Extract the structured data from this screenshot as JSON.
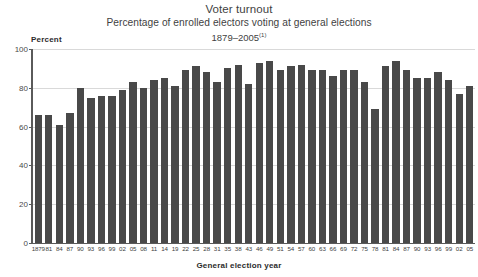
{
  "header": {
    "title": "Voter turnout",
    "subtitle": "Percentage of enrolled electors voting at general elections",
    "period": "1879–2005",
    "footnote_marker": "(1)"
  },
  "axes": {
    "y_axis_title": "Percent",
    "x_axis_title": "General election year",
    "y_ticks": [
      "0",
      "20",
      "40",
      "60",
      "80",
      "100"
    ]
  },
  "chart_data": {
    "type": "bar",
    "title": "Voter turnout",
    "subtitle": "Percentage of enrolled electors voting at general elections",
    "period": "1879–2005",
    "xlabel": "General election year",
    "ylabel": "Percent",
    "ylim": [
      0,
      100
    ],
    "ytick_values": [
      0,
      20,
      40,
      60,
      80,
      100
    ],
    "grid": true,
    "legend": "none",
    "bar_color": "#494949",
    "categories": [
      "1879",
      "81",
      "84",
      "87",
      "90",
      "93",
      "96",
      "99",
      "02",
      "05",
      "08",
      "11",
      "14",
      "19",
      "22",
      "25",
      "28",
      "31",
      "35",
      "38",
      "43",
      "46",
      "49",
      "51",
      "54",
      "57",
      "60",
      "63",
      "66",
      "69",
      "72",
      "75",
      "78",
      "81",
      "84",
      "87",
      "90",
      "93",
      "96",
      "99",
      "02",
      "05"
    ],
    "values": [
      66,
      66,
      61,
      67,
      80,
      75,
      76,
      76,
      79,
      83,
      80,
      84,
      85,
      81,
      89,
      91,
      88,
      83,
      90,
      92,
      82,
      93,
      94,
      89,
      91,
      92,
      89,
      89,
      86,
      89,
      89,
      83,
      69,
      91,
      94,
      89,
      85,
      85,
      88,
      84,
      77,
      81
    ],
    "footnote_marker": "(1)"
  }
}
